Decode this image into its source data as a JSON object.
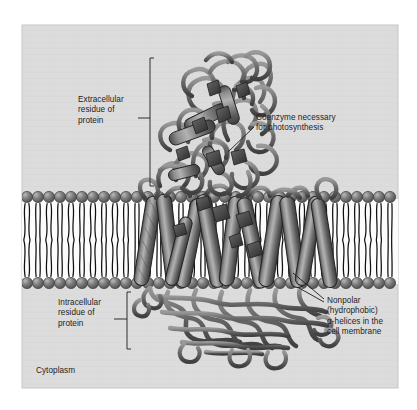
{
  "figure": {
    "panel": {
      "background_color": "#dcdcdc",
      "border_color": "#c9c9c9",
      "x": 22,
      "y": 25,
      "width": 376,
      "height": 363
    },
    "membrane": {
      "name": "cell-membrane",
      "type": "phospholipid-bilayer",
      "head_color": "#6e6e6e",
      "tail_color": "#101010",
      "interior_color": "#fdfdfd",
      "upper_leaflet_head_y": 197,
      "lower_leaflet_head_y": 283,
      "head_radius": 5.6,
      "lipid_spacing": 11.0,
      "leaflet_tail_length": 36
    },
    "protein": {
      "name": "transmembrane-photosynthetic-reaction-center",
      "fill_color": "#7b7b7b",
      "stroke_color": "#2b2b2b",
      "helix_count": 11,
      "cofactor_color": "#3a3a3a",
      "domains": [
        "extracellular",
        "transmembrane",
        "intracellular"
      ]
    }
  },
  "labels": {
    "extracellular": {
      "id": "extracellular-residue-label",
      "text": "Extracellular\nresidue of\nprotein",
      "bracket": {
        "x": 150,
        "y_top": 58,
        "y_bottom": 186,
        "tick_y": 118,
        "tick_x_end": 138
      }
    },
    "coenzyme": {
      "id": "coenzyme-label",
      "text": "Coenzyme necessary\nfor photosynthesis",
      "leader": {
        "x1": 253,
        "y1": 128,
        "x2": 228,
        "y2": 152
      }
    },
    "intracellular": {
      "id": "intracellular-residue-label",
      "text": "Intracellular\nresidue of\nprotein",
      "bracket": {
        "x": 127,
        "y_top": 292,
        "y_bottom": 349,
        "tick_y": 319,
        "tick_x_end": 115
      }
    },
    "nonpolar": {
      "id": "nonpolar-helices-label",
      "text": "Nonpolar\n(hydrophobic)\nα-helices in the\ncell membrane",
      "leaders": [
        {
          "x1": 325,
          "y1": 300,
          "x2": 295,
          "y2": 275
        },
        {
          "x1": 325,
          "y1": 302,
          "x2": 300,
          "y2": 288
        }
      ]
    },
    "cytoplasm": {
      "id": "cytoplasm-label",
      "text": "Cytoplasm"
    }
  },
  "colors": {
    "panel_bg": "#dcdcdc",
    "outer_bg": "#ffffff",
    "text": "#1c1c1c",
    "leader_line": "#1c1c1c",
    "membrane_head": "#6e6e6e",
    "protein_fill": "#7b7b7b"
  }
}
